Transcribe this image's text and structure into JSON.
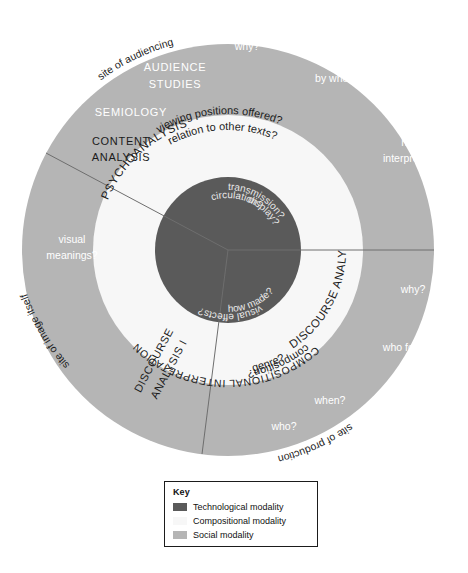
{
  "figure": {
    "type": "concentric-ring-diagram"
  },
  "colors": {
    "technological": "#5a5a5a",
    "compositional": "#f7f7f7",
    "social": "#b5b5b5",
    "outline": "#6e6e6e",
    "dark_text": "#1b1b1b",
    "light_text": "#ffffff",
    "page_background": "#ffffff"
  },
  "rings": [
    {
      "name": "technological modality",
      "order": "inner",
      "fill": "#5a5a5a"
    },
    {
      "name": "compositional modality",
      "order": "middle",
      "fill": "#f7f7f7"
    },
    {
      "name": "social modality",
      "order": "outer",
      "fill": "#b5b5b5"
    }
  ],
  "sectors": [
    {
      "name": "site of audiencing"
    },
    {
      "name": "site of production"
    },
    {
      "name": "site of image itself"
    }
  ],
  "labels": {
    "sites": [
      {
        "text": "site of audiencing",
        "position": "outer-top-right"
      },
      {
        "text": "site of production",
        "position": "outer-bottom-right"
      },
      {
        "text": "site of image itself",
        "position": "outer-left"
      }
    ],
    "methods_outer": [
      {
        "text": "AUDIENCE",
        "position": "outer-ring-top-left"
      },
      {
        "text": "STUDIES",
        "position": "outer-ring-top-left"
      },
      {
        "text": "SEMIOLOGY",
        "position": "outer-ring-left"
      },
      {
        "text": "CONTENT",
        "position": "outer-ring-left"
      },
      {
        "text": "ANALYSIS",
        "position": "outer-ring-left"
      }
    ],
    "methods_middle": [
      {
        "text": "PSYCHOANALYSIS",
        "position": "middle-ring-upper-left"
      },
      {
        "text": "COMPOSITIONAL INTERPRETATION",
        "position": "middle-ring-left"
      },
      {
        "text": "DISCOURSE ANALYSIS I",
        "position": "middle-ring-bottom-left"
      },
      {
        "text": "DISCOURSE ANALYSIS II",
        "position": "middle-ring-bottom-right"
      }
    ],
    "questions_outer": [
      {
        "text": "why?",
        "position": "outer-top"
      },
      {
        "text": "by whom?",
        "position": "outer-upper-right"
      },
      {
        "text": "how",
        "position": "outer-right"
      },
      {
        "text": "interpreted?",
        "position": "outer-right"
      },
      {
        "text": "why?",
        "position": "outer-lower-right"
      },
      {
        "text": "who for?",
        "position": "outer-lower-right"
      },
      {
        "text": "when?",
        "position": "outer-bottom-right"
      },
      {
        "text": "who?",
        "position": "outer-bottom"
      },
      {
        "text": "visual",
        "position": "outer-left"
      },
      {
        "text": "meanings?",
        "position": "outer-left"
      }
    ],
    "questions_middle": [
      {
        "text": "viewing positions offered?",
        "position": "middle-top-right"
      },
      {
        "text": "relation to other texts?",
        "position": "middle-upper-right"
      },
      {
        "text": "genre?",
        "position": "middle-lower-right"
      },
      {
        "text": "composition?",
        "position": "middle-lower-left"
      }
    ],
    "questions_inner": [
      {
        "text": "transmission?",
        "position": "inner-top-right"
      },
      {
        "text": "circulation?",
        "position": "inner-top-right"
      },
      {
        "text": "display?",
        "position": "inner-top-right"
      },
      {
        "text": "visual effects?",
        "position": "inner-left"
      },
      {
        "text": "how made?",
        "position": "inner-bottom-right"
      }
    ]
  },
  "key": {
    "title": "Key",
    "items": [
      {
        "label": "Technological modality",
        "color": "#5a5a5a"
      },
      {
        "label": "Compositional modality",
        "color": "#f7f7f7"
      },
      {
        "label": "Social modality",
        "color": "#b5b5b5"
      }
    ]
  }
}
